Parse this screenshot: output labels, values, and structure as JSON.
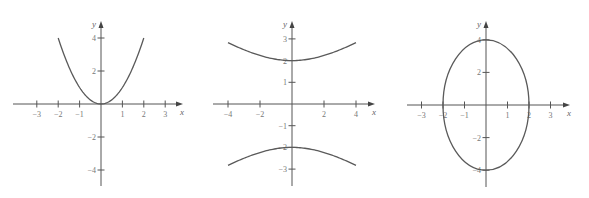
{
  "colors": {
    "axis": "#555555",
    "curve": "#5a5a5a",
    "label": "#777777"
  },
  "chart_data": [
    {
      "type": "line",
      "title": "",
      "equation": "y = x^2",
      "xlabel": "x",
      "ylabel": "y",
      "grid": false,
      "xlim": [
        -3.5,
        3.8
      ],
      "ylim": [
        -5,
        5
      ],
      "x_ticks": [
        -3,
        -2,
        -1,
        1,
        2,
        3
      ],
      "x_tick_labels": [
        "−3",
        "−2",
        "−1",
        "1",
        "2",
        "3"
      ],
      "y_ticks": [
        4,
        2,
        -2,
        -4
      ],
      "y_tick_labels": [
        "4",
        "2",
        "−2",
        "−4"
      ],
      "series": [
        {
          "name": "parabola",
          "x": [
            -2,
            -1.5,
            -1,
            -0.5,
            0,
            0.5,
            1,
            1.5,
            2
          ],
          "y": [
            4,
            2.25,
            1,
            0.25,
            0,
            0.25,
            1,
            2.25,
            4
          ]
        }
      ],
      "layout": {
        "ox": 101,
        "oy": 104,
        "sx": 21.4,
        "sy": 16.5,
        "x_from": 13,
        "x_to": 183,
        "y_top": 21,
        "y_bottom": 186
      }
    },
    {
      "type": "line",
      "title": "",
      "equation": "y^2/4 - x^2/16 = 1",
      "xlabel": "x",
      "ylabel": "y",
      "grid": false,
      "xlim": [
        -4.5,
        5.2
      ],
      "ylim": [
        -3.7,
        3.8
      ],
      "x_ticks": [
        -4,
        -2,
        2,
        4
      ],
      "x_tick_labels": [
        "−4",
        "−2",
        "2",
        "4"
      ],
      "y_ticks": [
        3,
        2,
        1,
        -1,
        -2,
        -3
      ],
      "y_tick_labels": [
        "3",
        "2",
        "1",
        "−1",
        "−2",
        "−3"
      ],
      "series": [
        {
          "name": "upper branch",
          "x": [
            -4,
            -3,
            -2,
            -1,
            0,
            1,
            2,
            3,
            4
          ],
          "y": [
            2.83,
            2.5,
            2.24,
            2.06,
            2,
            2.06,
            2.24,
            2.5,
            2.83
          ]
        },
        {
          "name": "lower branch",
          "x": [
            -4,
            -3,
            -2,
            -1,
            0,
            1,
            2,
            3,
            4
          ],
          "y": [
            -2.83,
            -2.5,
            -2.24,
            -2.06,
            -2,
            -2.06,
            -2.24,
            -2.5,
            -2.83
          ]
        }
      ],
      "layout": {
        "ox": 292,
        "oy": 104,
        "sx": 16,
        "sy": 21.7,
        "x_from": 213,
        "x_to": 375,
        "y_top": 21,
        "y_bottom": 186
      }
    },
    {
      "type": "line",
      "title": "",
      "equation": "x^2/4 + y^2/16 = 1",
      "xlabel": "x",
      "ylabel": "y",
      "grid": false,
      "xlim": [
        -3.5,
        3.9
      ],
      "ylim": [
        -5,
        5
      ],
      "x_ticks": [
        -3,
        -2,
        -1,
        1,
        2,
        3
      ],
      "x_tick_labels": [
        "−3",
        "−2",
        "−1",
        "1",
        "2",
        "3"
      ],
      "y_ticks": [
        4,
        2,
        -2,
        -4
      ],
      "y_tick_labels": [
        "4",
        "2",
        "−2",
        "−4"
      ],
      "series": [
        {
          "name": "ellipse",
          "semi_axis_x": 2,
          "semi_axis_y": 4,
          "center": [
            0,
            0
          ]
        }
      ],
      "layout": {
        "ox": 486,
        "oy": 105,
        "sx": 21.5,
        "sy": 16.3,
        "x_from": 407,
        "x_to": 570,
        "y_top": 21,
        "y_bottom": 187
      }
    }
  ]
}
